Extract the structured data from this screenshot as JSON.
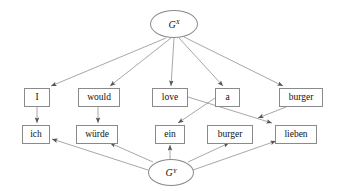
{
  "diagram": {
    "type": "directed-graph",
    "title": "",
    "background_color": "#ffffff",
    "edge_color": "#6b6b6b",
    "node_border_color": "#8a8a8a",
    "node_fill_color": "#ffffff",
    "text_color": "#111111",
    "nodes": [
      {
        "id": "gx",
        "label": "G",
        "superscript": "X",
        "shape": "ellipse",
        "x": 150,
        "y": 10,
        "w": 48,
        "h": 28
      },
      {
        "id": "i",
        "label": "I",
        "shape": "box",
        "x": 24,
        "y": 88,
        "w": 26,
        "h": 19
      },
      {
        "id": "would",
        "label": "would",
        "shape": "box",
        "x": 78,
        "y": 88,
        "w": 42,
        "h": 19
      },
      {
        "id": "love",
        "label": "love",
        "shape": "box",
        "x": 152,
        "y": 88,
        "w": 36,
        "h": 19
      },
      {
        "id": "a",
        "label": "a",
        "shape": "box",
        "x": 215,
        "y": 88,
        "w": 25,
        "h": 19
      },
      {
        "id": "burger_en",
        "label": "burger",
        "shape": "box",
        "x": 279,
        "y": 88,
        "w": 44,
        "h": 19
      },
      {
        "id": "ich",
        "label": "ich",
        "shape": "box",
        "x": 22,
        "y": 125,
        "w": 28,
        "h": 19
      },
      {
        "id": "wuerde",
        "label": "würde",
        "shape": "box",
        "x": 76,
        "y": 125,
        "w": 42,
        "h": 19
      },
      {
        "id": "ein",
        "label": "ein",
        "shape": "box",
        "x": 155,
        "y": 125,
        "w": 30,
        "h": 19
      },
      {
        "id": "burger_de",
        "label": "burger",
        "shape": "box",
        "x": 207,
        "y": 125,
        "w": 46,
        "h": 19
      },
      {
        "id": "lieben",
        "label": "lieben",
        "shape": "box",
        "x": 275,
        "y": 125,
        "w": 42,
        "h": 19
      },
      {
        "id": "gy",
        "label": "G",
        "superscript": "Y",
        "shape": "ellipse",
        "x": 148,
        "y": 159,
        "w": 46,
        "h": 27
      }
    ],
    "edges": [
      {
        "from": "gx",
        "to": "i",
        "path": "M 166,38 L 51,86",
        "arrow": true
      },
      {
        "from": "gx",
        "to": "would",
        "path": "M 171,38 L 110,86",
        "arrow": true
      },
      {
        "from": "gx",
        "to": "love",
        "path": "M 174,38 L 171,86",
        "arrow": true
      },
      {
        "from": "gx",
        "to": "a",
        "path": "M 179,38 L 223,86",
        "arrow": true
      },
      {
        "from": "gx",
        "to": "burger_en",
        "path": "M 184,37 L 283,86",
        "arrow": true
      },
      {
        "from": "i",
        "to": "ich",
        "path": "M 37,107 L 37,123",
        "arrow": true
      },
      {
        "from": "would",
        "to": "wuerde",
        "path": "M 98,107 L 98,123",
        "arrow": true
      },
      {
        "from": "love",
        "to": "lieben",
        "path": "M 188,97 L 272,123",
        "arrow": true
      },
      {
        "from": "a",
        "to": "ein",
        "path": "M 215,98 L 178,123",
        "arrow": true
      },
      {
        "from": "burger_en",
        "to": "burger_de",
        "path": "M 286,107 L 258,118",
        "arrow": true
      },
      {
        "from": "gy",
        "to": "ich",
        "path": "M 148,170 L 52,139",
        "arrow": true
      },
      {
        "from": "gy",
        "to": "wuerde",
        "path": "M 153,162 L 110,143",
        "arrow": true
      },
      {
        "from": "gy",
        "to": "ein",
        "path": "M 170,159 L 170,145",
        "arrow": true
      },
      {
        "from": "gy",
        "to": "burger_de",
        "path": "M 188,162 L 229,143",
        "arrow": true
      },
      {
        "from": "gy",
        "to": "lieben",
        "path": "M 193,170 L 276,141",
        "arrow": true
      }
    ]
  }
}
